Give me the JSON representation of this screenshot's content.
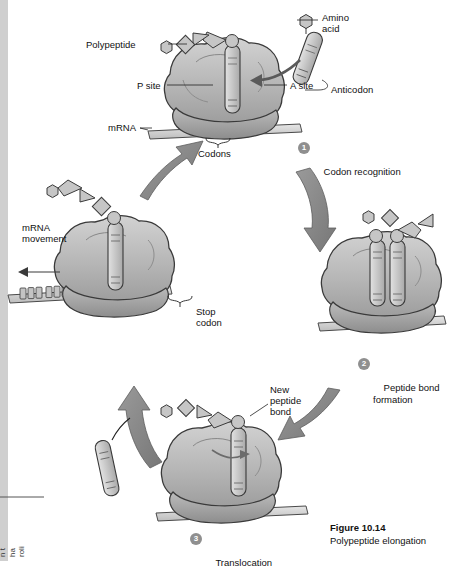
{
  "figure": {
    "number": "Figure 10.14",
    "caption": "Polypeptide elongation"
  },
  "labels": {
    "amino_acid": "Amino\nacid",
    "polypeptide": "Polypeptide",
    "p_site": "P site",
    "a_site": "A site",
    "anticodon": "Anticodon",
    "mrna": "mRNA",
    "codons": "Codons",
    "mrna_movement": "mRNA\nmovement",
    "stop_codon": "Stop\ncodon",
    "new_peptide_bond": "New\npeptide\nbond"
  },
  "steps": [
    {
      "num": "1",
      "text": "Codon recognition"
    },
    {
      "num": "2",
      "text": "Peptide bond\nformation"
    },
    {
      "num": "3",
      "text": "Translocation"
    }
  ],
  "margin_note": "n t\nha\nroli",
  "colors": {
    "ribosome_fill": "#b9b9b9",
    "ribosome_dark": "#8f8f8f",
    "trna_fill": "#c9c9c9",
    "arrow_fill": "#8a8a8a",
    "mrna_fill": "#d8d8d8",
    "outline": "#3a3a3a",
    "badge_bg": "#8f8f8f"
  }
}
